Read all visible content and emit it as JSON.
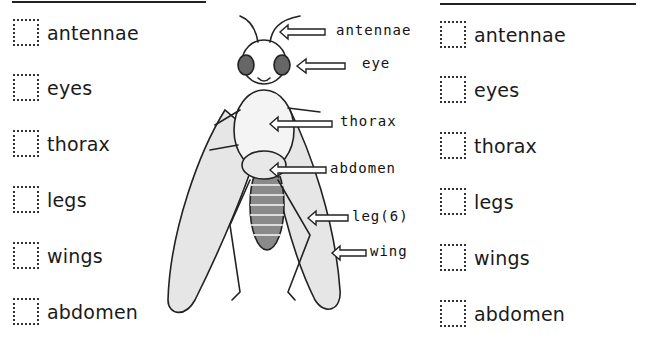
{
  "left_list": {
    "items": [
      {
        "label": "antennae"
      },
      {
        "label": "eyes"
      },
      {
        "label": "thorax"
      },
      {
        "label": "legs"
      },
      {
        "label": "wings"
      },
      {
        "label": "abdomen"
      }
    ]
  },
  "right_list": {
    "items": [
      {
        "label": "antennae"
      },
      {
        "label": "eyes"
      },
      {
        "label": "thorax"
      },
      {
        "label": "legs"
      },
      {
        "label": "wings"
      },
      {
        "label": "abdomen"
      }
    ]
  },
  "diagram": {
    "labels": {
      "antennae": "antennae",
      "eye": "eye",
      "thorax": "thorax",
      "abdomen": "abdomen",
      "leg": "leg(6)",
      "wing": "wing"
    }
  }
}
